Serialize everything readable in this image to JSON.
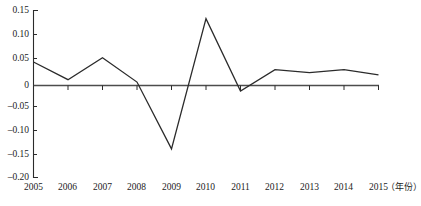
{
  "chart_data": {
    "type": "line",
    "title": "",
    "subtitle": "",
    "xlabel": "（年份）",
    "ylabel": "",
    "categories": [
      "2005",
      "2006",
      "2007",
      "2008",
      "2009",
      "2010",
      "2011",
      "2012",
      "2013",
      "2014",
      "2015"
    ],
    "x": [
      2005,
      2006,
      2007,
      2008,
      2009,
      2010,
      2011,
      2012,
      2013,
      2014,
      2015
    ],
    "values": [
      0.042,
      0.005,
      0.051,
      0.0,
      -0.14,
      0.133,
      -0.019,
      0.026,
      0.02,
      0.026,
      0.015
    ],
    "series": [
      {
        "name": "",
        "values": [
          0.042,
          0.005,
          0.051,
          0.0,
          -0.14,
          0.133,
          -0.019,
          0.026,
          0.02,
          0.026,
          0.015
        ]
      }
    ],
    "ylim": [
      -0.2,
      0.15
    ],
    "xlim": [
      2005,
      2015
    ],
    "yticks": [
      0.15,
      0.1,
      0.05,
      0,
      -0.05,
      -0.1,
      -0.15,
      -0.2
    ],
    "ytick_labels": [
      "0.15",
      "0.10",
      "0.05",
      "0",
      "–0.05",
      "–0.10",
      "–0.15",
      "–0.20"
    ],
    "xtick_labels": [
      "2005",
      "2006",
      "2007",
      "2008",
      "2009",
      "2010",
      "2011",
      "2012",
      "2013",
      "2014",
      "2015"
    ],
    "grid": false,
    "legend": false,
    "legend_position": "none",
    "line_color": "#2b2b2b",
    "axis_color": "#2b2b2b",
    "zero_line_color": "#555555",
    "background_color": "#ffffff",
    "annotations": []
  },
  "axis": {
    "y_labels": [
      {
        "text": "0.15"
      },
      {
        "text": "0.10"
      },
      {
        "text": "0.05"
      },
      {
        "text": "0"
      },
      {
        "text": "–0.05"
      },
      {
        "text": "–0.10"
      },
      {
        "text": "–0.15"
      },
      {
        "text": "–0.20"
      }
    ],
    "x_labels": [
      {
        "text": "2005"
      },
      {
        "text": "2006"
      },
      {
        "text": "2007"
      },
      {
        "text": "2008"
      },
      {
        "text": "2009"
      },
      {
        "text": "2010"
      },
      {
        "text": "2011"
      },
      {
        "text": "2012"
      },
      {
        "text": "2013"
      },
      {
        "text": "2014"
      },
      {
        "text": "2015"
      }
    ],
    "x_title": "（年份）"
  }
}
